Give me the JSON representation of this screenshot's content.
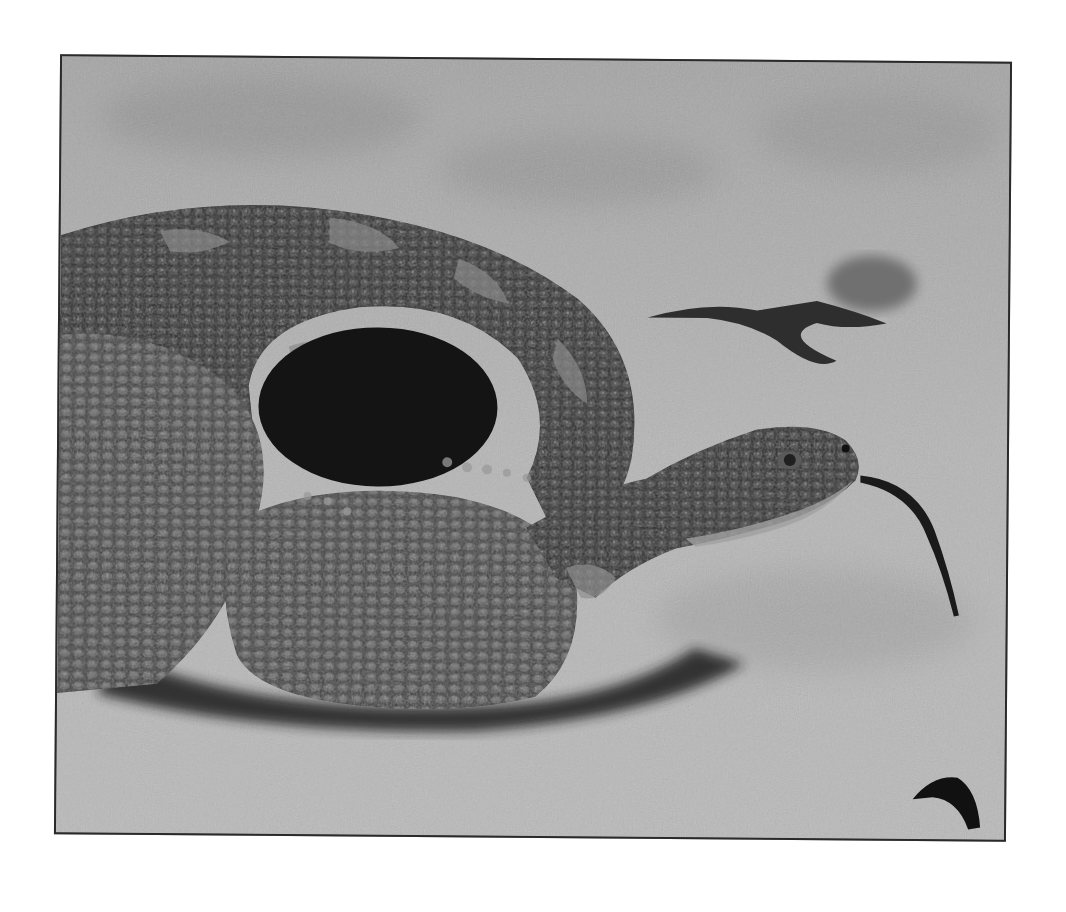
{
  "image": {
    "subject": "rattlesnake coiled on sand with tongue extended",
    "style": "grayscale photograph with thin dark border",
    "colors": {
      "page_background": "#ffffff",
      "frame_border": "#2a2a2a",
      "sand_light": "#b8b8b8",
      "sand_mid": "#9a9a9a",
      "sand_dark": "#7a7a7a",
      "snake_dark": "#2b2b2b",
      "snake_mid": "#4a4a4a",
      "snake_light": "#8a8a8a",
      "tongue": "#1a1a1a",
      "shadow": "#1e1e1e"
    },
    "elements": [
      "coiled-snake-body",
      "snake-head",
      "forked-tongue",
      "dried-leaf-on-sand",
      "small-dark-object-bottom-right",
      "sand-background"
    ]
  }
}
